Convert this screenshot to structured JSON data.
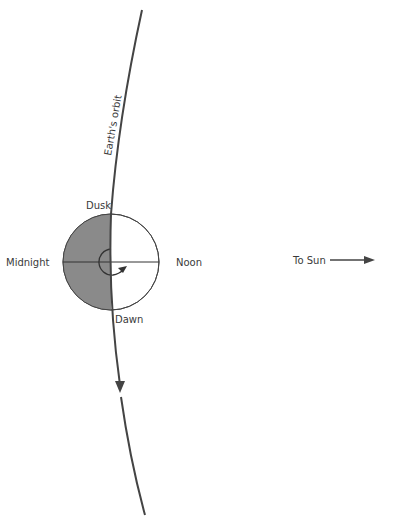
{
  "labels": {
    "orbit": "Earth's orbit",
    "dusk": "Dusk",
    "dawn": "Dawn",
    "midnight": "Midnight",
    "noon": "Noon",
    "to_sun": "To Sun"
  },
  "colors": {
    "line": "#444444",
    "night_shade": "#8a8a8a",
    "background": "#ffffff"
  }
}
